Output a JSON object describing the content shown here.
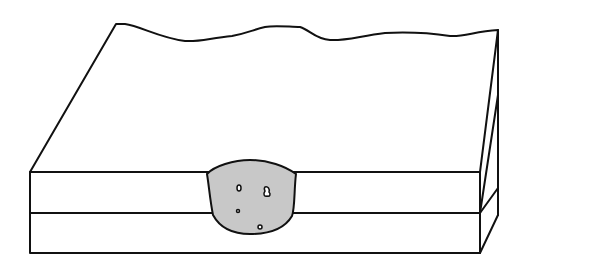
{
  "diagram": {
    "colors": {
      "background": "#ffffff",
      "line": "#111111",
      "weld_fill": "#c8c8c8"
    },
    "components": [
      {
        "name": "top-plate",
        "label": ""
      },
      {
        "name": "bottom-plate",
        "label": ""
      },
      {
        "name": "weld-nugget",
        "label": ""
      },
      {
        "name": "porosity-voids",
        "count": 4
      }
    ]
  }
}
